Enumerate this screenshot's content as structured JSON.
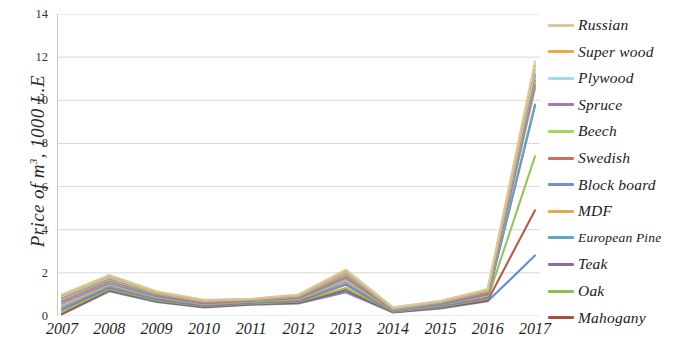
{
  "chart_data": {
    "type": "line",
    "title": "",
    "xlabel": "",
    "ylabel": "Price of m³ , 1000 L.E",
    "ylabel_parts": {
      "italic_prefix": "Price of m",
      "superscript": "3",
      "suffix": ", 1000 L.E"
    },
    "x": [
      "2007",
      "2008",
      "2009",
      "2010",
      "2011",
      "2012",
      "2013",
      "2014",
      "2015",
      "2016",
      "2017"
    ],
    "xlim": [
      "2007",
      "2017"
    ],
    "ylim": [
      0,
      14
    ],
    "yticks": [
      0,
      2,
      4,
      6,
      8,
      10,
      12,
      14
    ],
    "grid": "horizontal",
    "legend_position": "right",
    "series": [
      {
        "name": "Russian",
        "color": "#d9c89a",
        "values": [
          1.0,
          1.9,
          1.15,
          0.75,
          0.8,
          1.0,
          2.15,
          0.4,
          0.7,
          1.25,
          11.8
        ]
      },
      {
        "name": "Super wood",
        "color": "#eda64a",
        "values": [
          0.95,
          1.85,
          1.1,
          0.72,
          0.78,
          0.97,
          2.1,
          0.38,
          0.68,
          1.2,
          11.6
        ]
      },
      {
        "name": "Plywood",
        "color": "#9fdcee",
        "values": [
          0.9,
          1.8,
          1.08,
          0.7,
          0.78,
          0.95,
          2.05,
          0.36,
          0.66,
          1.18,
          11.4
        ]
      },
      {
        "name": "Spruce",
        "color": "#9b7cb8",
        "values": [
          0.85,
          1.75,
          1.05,
          0.68,
          0.76,
          0.92,
          2.0,
          0.34,
          0.64,
          1.15,
          11.2
        ]
      },
      {
        "name": "Beech",
        "color": "#a6d55a",
        "values": [
          0.8,
          1.7,
          1.02,
          0.66,
          0.74,
          0.9,
          1.95,
          0.32,
          0.62,
          1.12,
          11.05
        ]
      },
      {
        "name": "Swedish",
        "color": "#cf6c5c",
        "values": [
          0.7,
          1.62,
          0.98,
          0.62,
          0.72,
          0.86,
          1.85,
          0.3,
          0.58,
          1.05,
          10.9
        ]
      },
      {
        "name": "Block board",
        "color": "#6f8fd6",
        "values": [
          0.6,
          1.52,
          0.92,
          0.58,
          0.7,
          0.82,
          1.75,
          0.28,
          0.54,
          1.0,
          10.7
        ]
      },
      {
        "name": "MDF",
        "color": "#e8a652",
        "values": [
          0.5,
          1.45,
          0.88,
          0.55,
          0.68,
          0.78,
          1.65,
          0.26,
          0.52,
          0.95,
          10.55
        ]
      },
      {
        "name": "European Pine",
        "color": "#5aa8c4",
        "values": [
          0.4,
          1.38,
          0.82,
          0.52,
          0.65,
          0.74,
          1.55,
          0.24,
          0.48,
          0.9,
          9.8
        ]
      },
      {
        "name": "Teak",
        "color": "#8b6bb0",
        "values": [
          0.3,
          1.32,
          0.78,
          0.48,
          0.62,
          0.7,
          1.45,
          0.22,
          0.45,
          0.85,
          9.75
        ]
      },
      {
        "name": "Oak",
        "color": "#8fbe4e",
        "values": [
          0.2,
          1.25,
          0.72,
          0.45,
          0.58,
          0.66,
          1.3,
          0.2,
          0.42,
          0.8,
          7.4
        ]
      },
      {
        "name": "Mahogany",
        "color": "#a8503f",
        "values": [
          0.1,
          1.2,
          0.68,
          0.42,
          0.55,
          0.62,
          1.2,
          0.18,
          0.38,
          0.72,
          4.9
        ]
      }
    ],
    "extra_lines": [
      {
        "name": "lowest-blue",
        "color": "#5b7fd0",
        "values": [
          0.08,
          1.15,
          0.65,
          0.4,
          0.52,
          0.58,
          1.1,
          0.16,
          0.35,
          0.68,
          2.8
        ]
      }
    ]
  },
  "legend": {
    "items": [
      {
        "label": "Russian",
        "color": "#d9c89a"
      },
      {
        "label": "Super wood",
        "color": "#eda64a"
      },
      {
        "label": "Plywood",
        "color": "#9fdcee"
      },
      {
        "label": "Spruce",
        "color": "#9b7cb8"
      },
      {
        "label": "Beech",
        "color": "#a6d55a"
      },
      {
        "label": "Swedish",
        "color": "#cf6c5c"
      },
      {
        "label": "Block board",
        "color": "#6f8fd6"
      },
      {
        "label": "MDF",
        "color": "#e8a652"
      },
      {
        "label": "European Pine",
        "color": "#5aa8c4"
      },
      {
        "label": "Teak",
        "color": "#8b6bb0"
      },
      {
        "label": "Oak",
        "color": "#8fbe4e"
      },
      {
        "label": "Mahogany",
        "color": "#a8503f"
      }
    ]
  },
  "axes": {
    "y_title_italic": "Price of m",
    "y_title_sup": "3",
    "y_title_tail": ", 1000 L.E",
    "y_tick_labels": [
      "14",
      "12",
      "10",
      "8",
      "6",
      "4",
      "2",
      "0"
    ],
    "x_tick_labels": [
      "2007",
      "2008",
      "2009",
      "2010",
      "2011",
      "2012",
      "2013",
      "2014",
      "2015",
      "2016",
      "2017"
    ]
  },
  "style": {
    "grid_color": "#d8d8d8",
    "axis_color": "#c9c9c9",
    "background": "#ffffff"
  }
}
